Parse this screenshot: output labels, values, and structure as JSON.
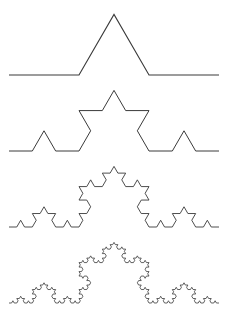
{
  "diagram": {
    "stroke_color": "#3a3a3a",
    "background": "#ffffff",
    "curves": [
      {
        "name": "koch-iteration-1",
        "iteration": 1,
        "x_start": 9,
        "x_end": 219,
        "baseline_y": 75,
        "stroke_width": 1.1
      },
      {
        "name": "koch-iteration-2",
        "iteration": 2,
        "x_start": 9,
        "x_end": 219,
        "baseline_y": 151,
        "stroke_width": 1.0
      },
      {
        "name": "koch-iteration-3",
        "iteration": 3,
        "x_start": 9,
        "x_end": 219,
        "baseline_y": 227,
        "stroke_width": 0.9
      },
      {
        "name": "koch-iteration-4",
        "iteration": 4,
        "x_start": 9,
        "x_end": 219,
        "baseline_y": 303,
        "stroke_width": 0.8
      }
    ]
  }
}
